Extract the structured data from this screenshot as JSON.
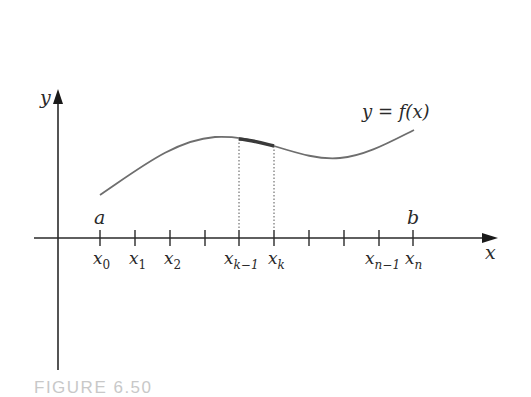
{
  "figure": {
    "caption": "FIGURE 6.50",
    "function_label": "y = f(x)",
    "axes": {
      "x_label": "x",
      "y_label": "y"
    },
    "endpoints": {
      "a": "a",
      "b": "b"
    },
    "partition_points": [
      {
        "base": "x",
        "sub": "0"
      },
      {
        "base": "x",
        "sub": "1"
      },
      {
        "base": "x",
        "sub": "2"
      },
      {
        "base": "",
        "sub": ""
      },
      {
        "base": "x",
        "sub": "k−1"
      },
      {
        "base": "x",
        "sub": "k"
      },
      {
        "base": "",
        "sub": ""
      },
      {
        "base": "",
        "sub": ""
      },
      {
        "base": "x",
        "sub": "n−1"
      },
      {
        "base": "x",
        "sub": "n"
      }
    ],
    "highlighted_subinterval": "[x_{k-1}, x_k]",
    "colors": {
      "axis": "#2a2a2a",
      "curve": "#6e6e6e",
      "highlight": "#3a3a3a",
      "caption": "#c8c8c8"
    }
  }
}
